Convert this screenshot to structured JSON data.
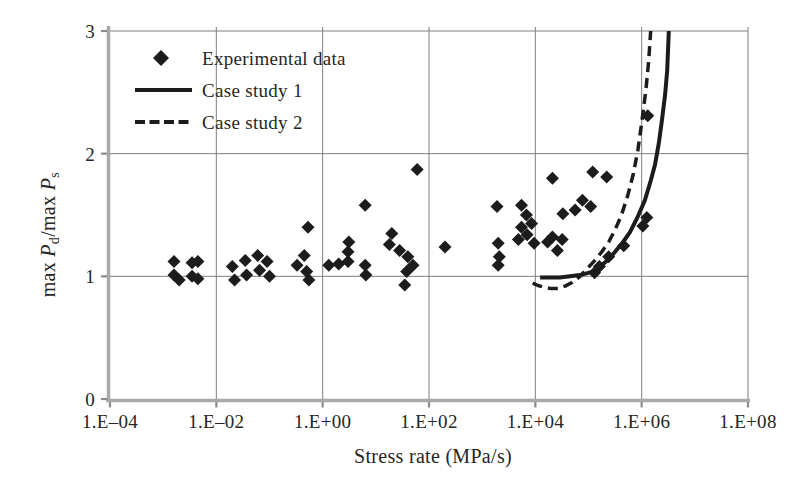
{
  "chart_data": {
    "type": "scatter",
    "title": "",
    "xlabel": "Stress rate (MPa/s)",
    "ylabel": "max Pd/max Ps",
    "ylabel_parts": [
      "max ",
      "P",
      "d",
      "/max ",
      "P",
      "s"
    ],
    "x_scale": "log10",
    "x_range_log10": [
      -4,
      8
    ],
    "ylim": [
      0,
      3
    ],
    "x_tick_log10": [
      -4,
      -2,
      0,
      2,
      4,
      6,
      8
    ],
    "x_tick_labels": [
      "1.E–04",
      "1.E–02",
      "1.E+00",
      "1.E+02",
      "1.E+04",
      "1.E+06",
      "1.E+08"
    ],
    "y_ticks": [
      0,
      1,
      2,
      3
    ],
    "y_tick_labels": [
      "0",
      "1",
      "2",
      "3"
    ],
    "grid": true,
    "legend": {
      "position": "top-left-inside",
      "entries": [
        {
          "label": "Experimental data",
          "marker": "diamond-icon"
        },
        {
          "label": "Case study 1",
          "marker": "solid-line"
        },
        {
          "label": "Case study 2",
          "marker": "dashed-line"
        }
      ]
    },
    "colors": {
      "marker": "#1c1c1c",
      "line": "#1c1c1c",
      "grid": "#7f7f7f",
      "axis": "#a9a9a9",
      "tick": "#8c8c8c",
      "text": "#262626",
      "background": "#ffffff"
    },
    "series": [
      {
        "name": "Experimental data",
        "type": "scatter",
        "marker": "diamond",
        "points_x_y": [
          [
            0.0016,
            1.12
          ],
          [
            0.0016,
            1.01
          ],
          [
            0.002,
            0.97
          ],
          [
            0.0035,
            1.11
          ],
          [
            0.0045,
            1.12
          ],
          [
            0.0035,
            1.0
          ],
          [
            0.0045,
            0.98
          ],
          [
            0.02,
            1.08
          ],
          [
            0.022,
            0.97
          ],
          [
            0.035,
            1.13
          ],
          [
            0.037,
            1.01
          ],
          [
            0.06,
            1.17
          ],
          [
            0.065,
            1.05
          ],
          [
            0.09,
            1.12
          ],
          [
            0.1,
            1.0
          ],
          [
            0.33,
            1.09
          ],
          [
            0.45,
            1.17
          ],
          [
            0.5,
            1.04
          ],
          [
            0.53,
            1.4
          ],
          [
            0.55,
            0.97
          ],
          [
            1.3,
            1.09
          ],
          [
            2.0,
            1.1
          ],
          [
            3.0,
            1.2
          ],
          [
            3.0,
            1.12
          ],
          [
            3.1,
            1.28
          ],
          [
            6.3,
            1.58
          ],
          [
            6.3,
            1.09
          ],
          [
            6.5,
            1.01
          ],
          [
            18,
            1.26
          ],
          [
            20,
            1.35
          ],
          [
            28,
            1.21
          ],
          [
            35,
            0.93
          ],
          [
            38,
            1.04
          ],
          [
            40,
            1.16
          ],
          [
            50,
            1.09
          ],
          [
            60,
            1.87
          ],
          [
            200,
            1.24
          ],
          [
            1900,
            1.57
          ],
          [
            2000,
            1.27
          ],
          [
            2000,
            1.09
          ],
          [
            2100,
            1.16
          ],
          [
            4800,
            1.3
          ],
          [
            5500,
            1.58
          ],
          [
            5500,
            1.4
          ],
          [
            6800,
            1.5
          ],
          [
            7000,
            1.34
          ],
          [
            8500,
            1.43
          ],
          [
            9500,
            1.27
          ],
          [
            17000,
            1.28
          ],
          [
            21000,
            1.32
          ],
          [
            21000,
            1.8
          ],
          [
            26000,
            1.21
          ],
          [
            32000,
            1.3
          ],
          [
            33000,
            1.51
          ],
          [
            56000,
            1.54
          ],
          [
            77000,
            1.62
          ],
          [
            110000,
            1.57
          ],
          [
            120000,
            1.85
          ],
          [
            130000,
            1.03
          ],
          [
            160000,
            1.08
          ],
          [
            220000,
            1.81
          ],
          [
            240000,
            1.16
          ],
          [
            460000,
            1.25
          ],
          [
            1050000,
            1.41
          ],
          [
            1250000,
            1.48
          ],
          [
            1300000,
            2.31
          ]
        ]
      },
      {
        "name": "Case study 1",
        "type": "line",
        "style": "solid",
        "points_log10x_y": [
          [
            4.09,
            0.99
          ],
          [
            4.46,
            0.99
          ],
          [
            4.84,
            1.01
          ],
          [
            5.1,
            1.04
          ],
          [
            5.22,
            1.08
          ],
          [
            5.38,
            1.14
          ],
          [
            5.5,
            1.2
          ],
          [
            5.65,
            1.28
          ],
          [
            5.78,
            1.36
          ],
          [
            5.92,
            1.48
          ],
          [
            6.06,
            1.62
          ],
          [
            6.17,
            1.78
          ],
          [
            6.25,
            1.91
          ],
          [
            6.32,
            2.08
          ],
          [
            6.38,
            2.27
          ],
          [
            6.44,
            2.48
          ],
          [
            6.48,
            2.68
          ],
          [
            6.51,
            3.0
          ]
        ]
      },
      {
        "name": "Case study 2",
        "type": "line",
        "style": "dashed",
        "points_log10x_y": [
          [
            3.95,
            0.945
          ],
          [
            4.05,
            0.925
          ],
          [
            4.18,
            0.91
          ],
          [
            4.3,
            0.9
          ],
          [
            4.43,
            0.9
          ],
          [
            4.56,
            0.92
          ],
          [
            4.69,
            0.95
          ],
          [
            4.84,
            1.0
          ],
          [
            4.99,
            1.07
          ],
          [
            5.12,
            1.13
          ],
          [
            5.25,
            1.2
          ],
          [
            5.38,
            1.28
          ],
          [
            5.5,
            1.38
          ],
          [
            5.62,
            1.5
          ],
          [
            5.74,
            1.66
          ],
          [
            5.84,
            1.83
          ],
          [
            5.93,
            2.03
          ],
          [
            6.0,
            2.25
          ],
          [
            6.08,
            2.52
          ],
          [
            6.13,
            2.75
          ],
          [
            6.17,
            3.0
          ]
        ]
      }
    ]
  }
}
